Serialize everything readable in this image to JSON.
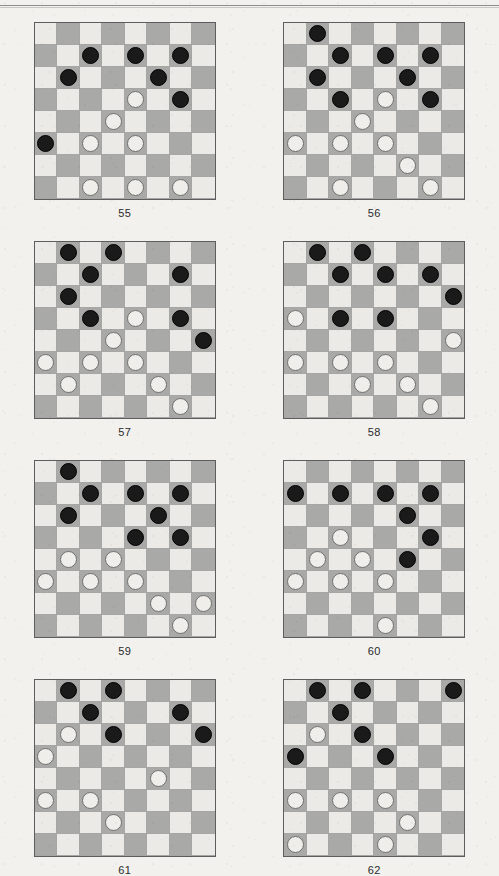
{
  "page": {
    "background_color": "#f2f1ee",
    "header_rule": true,
    "light_square_color": "#ebeae7",
    "dark_square_color": "#a9a9a7",
    "black_piece_color": "#1a1a1a",
    "white_piece_color": "#efeeea",
    "board_size": 8
  },
  "diagrams": [
    {
      "caption": "55",
      "rows": [
        [
          "",
          "",
          "",
          "",
          "",
          "",
          "",
          ""
        ],
        [
          "",
          "",
          "B",
          "",
          "B",
          "",
          "B",
          ""
        ],
        [
          "",
          "B",
          "",
          "",
          "",
          "B",
          "",
          ""
        ],
        [
          "",
          "",
          "",
          "",
          "W",
          "",
          "B",
          ""
        ],
        [
          "",
          "",
          "",
          "W",
          "",
          "",
          "",
          ""
        ],
        [
          "B",
          "",
          "W",
          "",
          "W",
          "",
          "",
          ""
        ],
        [
          "",
          "",
          "",
          "",
          "",
          "",
          "",
          ""
        ],
        [
          "",
          "",
          "W",
          "",
          "W",
          "",
          "W",
          ""
        ]
      ]
    },
    {
      "caption": "56",
      "rows": [
        [
          "",
          "B",
          "",
          "",
          "",
          "",
          "",
          ""
        ],
        [
          "",
          "",
          "B",
          "",
          "B",
          "",
          "B",
          ""
        ],
        [
          "",
          "B",
          "",
          "",
          "",
          "B",
          "",
          ""
        ],
        [
          "",
          "",
          "B",
          "",
          "W",
          "",
          "B",
          ""
        ],
        [
          "",
          "",
          "",
          "W",
          "",
          "",
          "",
          ""
        ],
        [
          "W",
          "",
          "W",
          "",
          "W",
          "",
          "",
          ""
        ],
        [
          "",
          "",
          "",
          "",
          "",
          "W",
          "",
          ""
        ],
        [
          "",
          "",
          "W",
          "",
          "",
          "",
          "W",
          ""
        ]
      ]
    },
    {
      "caption": "57",
      "rows": [
        [
          "",
          "B",
          "",
          "B",
          "",
          "",
          "",
          ""
        ],
        [
          "",
          "",
          "B",
          "",
          "",
          "",
          "B",
          ""
        ],
        [
          "",
          "B",
          "",
          "",
          "",
          "",
          "",
          ""
        ],
        [
          "",
          "",
          "B",
          "",
          "W",
          "",
          "B",
          ""
        ],
        [
          "",
          "",
          "",
          "W",
          "",
          "",
          "",
          "B"
        ],
        [
          "W",
          "",
          "W",
          "",
          "W",
          "",
          "",
          ""
        ],
        [
          "",
          "W",
          "",
          "",
          "",
          "W",
          "",
          ""
        ],
        [
          "",
          "",
          "",
          "",
          "",
          "",
          "W",
          ""
        ]
      ]
    },
    {
      "caption": "58",
      "rows": [
        [
          "",
          "B",
          "",
          "B",
          "",
          "",
          "",
          ""
        ],
        [
          "",
          "",
          "B",
          "",
          "B",
          "",
          "B",
          ""
        ],
        [
          "",
          "",
          "",
          "",
          "",
          "",
          "",
          "B"
        ],
        [
          "W",
          "",
          "B",
          "",
          "B",
          "",
          "",
          ""
        ],
        [
          "",
          "",
          "",
          "",
          "",
          "",
          "",
          "W"
        ],
        [
          "W",
          "",
          "W",
          "",
          "W",
          "",
          "",
          ""
        ],
        [
          "",
          "",
          "",
          "W",
          "",
          "W",
          "",
          ""
        ],
        [
          "",
          "",
          "",
          "",
          "",
          "",
          "W",
          ""
        ]
      ]
    },
    {
      "caption": "59",
      "rows": [
        [
          "",
          "B",
          "",
          "",
          "",
          "",
          "",
          ""
        ],
        [
          "",
          "",
          "B",
          "",
          "B",
          "",
          "B",
          ""
        ],
        [
          "",
          "B",
          "",
          "",
          "",
          "B",
          "",
          ""
        ],
        [
          "",
          "",
          "",
          "",
          "B",
          "",
          "B",
          ""
        ],
        [
          "",
          "W",
          "",
          "W",
          "",
          "",
          "",
          ""
        ],
        [
          "W",
          "",
          "W",
          "",
          "W",
          "",
          "",
          ""
        ],
        [
          "",
          "",
          "",
          "",
          "",
          "W",
          "",
          "W"
        ],
        [
          "",
          "",
          "",
          "",
          "",
          "",
          "W",
          ""
        ]
      ]
    },
    {
      "caption": "60",
      "rows": [
        [
          "",
          "",
          "",
          "",
          "",
          "",
          "",
          ""
        ],
        [
          "B",
          "",
          "B",
          "",
          "B",
          "",
          "B",
          ""
        ],
        [
          "",
          "",
          "",
          "",
          "",
          "B",
          "",
          ""
        ],
        [
          "",
          "",
          "W",
          "",
          "",
          "",
          "B",
          ""
        ],
        [
          "",
          "W",
          "",
          "W",
          "",
          "B",
          "",
          ""
        ],
        [
          "W",
          "",
          "W",
          "",
          "W",
          "",
          "",
          ""
        ],
        [
          "",
          "",
          "",
          "",
          "",
          "",
          "",
          ""
        ],
        [
          "",
          "",
          "",
          "",
          "W",
          "",
          "",
          ""
        ]
      ]
    },
    {
      "caption": "61",
      "rows": [
        [
          "",
          "B",
          "",
          "B",
          "",
          "",
          "",
          ""
        ],
        [
          "",
          "",
          "B",
          "",
          "",
          "",
          "B",
          ""
        ],
        [
          "",
          "W",
          "",
          "B",
          "",
          "",
          "",
          "B"
        ],
        [
          "W",
          "",
          "",
          "",
          "",
          "",
          "",
          ""
        ],
        [
          "",
          "",
          "",
          "",
          "",
          "W",
          "",
          ""
        ],
        [
          "W",
          "",
          "W",
          "",
          "",
          "",
          "",
          ""
        ],
        [
          "",
          "",
          "",
          "W",
          "",
          "",
          "",
          ""
        ],
        [
          "",
          "",
          "",
          "",
          "",
          "",
          "",
          ""
        ]
      ]
    },
    {
      "caption": "62",
      "rows": [
        [
          "",
          "B",
          "",
          "B",
          "",
          "",
          "",
          "B"
        ],
        [
          "",
          "",
          "B",
          "",
          "",
          "",
          "",
          ""
        ],
        [
          "",
          "W",
          "",
          "B",
          "",
          "",
          "",
          ""
        ],
        [
          "B",
          "",
          "",
          "",
          "B",
          "",
          "",
          ""
        ],
        [
          "",
          "",
          "",
          "",
          "",
          "",
          "",
          ""
        ],
        [
          "W",
          "",
          "W",
          "",
          "W",
          "",
          "",
          ""
        ],
        [
          "",
          "",
          "",
          "",
          "",
          "W",
          "",
          ""
        ],
        [
          "W",
          "",
          "",
          "",
          "W",
          "",
          "",
          ""
        ]
      ]
    }
  ]
}
